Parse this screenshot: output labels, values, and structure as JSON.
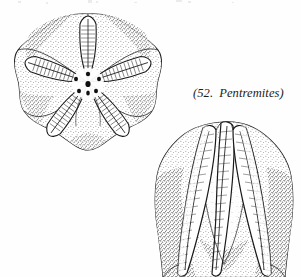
{
  "page": {
    "width": 301,
    "height": 277,
    "background_color": "#fefefe",
    "ink_color": "#1a1a1a"
  },
  "caption": {
    "full_text": "(52.  Pentremites)",
    "open_paren": "(",
    "number": "52.",
    "genus": "Pentremites",
    "close_paren": ")",
    "style": "italic serif",
    "color": "#1a1a1a"
  },
  "figures": [
    {
      "id": "oral-view",
      "label": "oral (top) view of Pentremites theca",
      "position": {
        "x": 14,
        "y": 13,
        "width": 148,
        "height": 139
      },
      "ambulacra_count": 5,
      "spiracle_count": 5,
      "has_central_mouth": true,
      "shading": "stipple"
    },
    {
      "id": "side-view",
      "label": "lateral (side) view of Pentremites theca",
      "position": {
        "x": 154,
        "y": 121,
        "width": 139,
        "height": 156
      },
      "ambulacra_visible": 3,
      "cropped_at_bottom": true,
      "shading": "stipple"
    }
  ],
  "top_edge_artifact": {
    "present": true,
    "description": "faint cropped remnants of a line of text above the figure"
  }
}
